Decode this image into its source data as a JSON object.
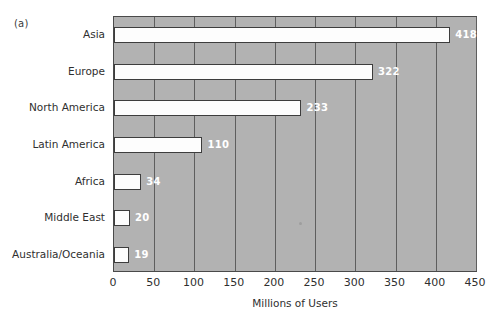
{
  "figure": {
    "panel_label": "(a)"
  },
  "chart_data": {
    "type": "bar",
    "orientation": "horizontal",
    "title": "",
    "subtitle": "",
    "xlabel": "Millions of Users",
    "ylabel": "",
    "categories": [
      "Asia",
      "Europe",
      "North America",
      "Latin America",
      "Africa",
      "Middle East",
      "Australia/Oceania"
    ],
    "values": [
      418,
      322,
      233,
      110,
      34,
      20,
      19
    ],
    "data_labels": [
      "418",
      "322",
      "233",
      "110",
      "34",
      "20",
      "19"
    ],
    "xlim": [
      0,
      450
    ],
    "xticks": [
      0,
      50,
      100,
      150,
      200,
      250,
      300,
      350,
      400,
      450
    ],
    "xtick_labels": [
      "0",
      "50",
      "100",
      "150",
      "200",
      "250",
      "300",
      "350",
      "400",
      "450"
    ],
    "grid": "vertical",
    "legend": "none",
    "colors": {
      "plot_background": "#b2b2b2",
      "bar_fill": "#fdfdfd",
      "bar_edge": "#3d3d3d",
      "gridline": "#5e5e5e",
      "axis_frame": "#4a4a4a",
      "data_label_text": "#ffffff",
      "tick_text": "#2f2f2f",
      "page_background": "#ffffff"
    }
  }
}
